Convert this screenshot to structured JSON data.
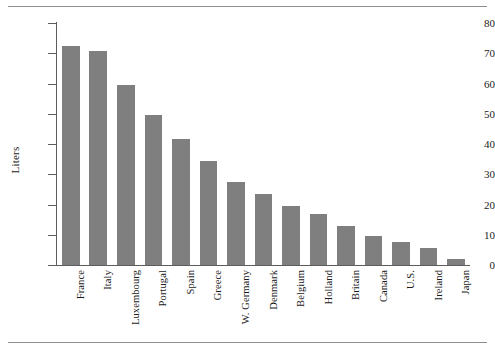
{
  "chart_data": {
    "type": "bar",
    "title": "",
    "subtitle": "",
    "xlabel": "",
    "ylabel": "Liters",
    "ylim": [
      0,
      80
    ],
    "yticks": [
      0,
      10,
      20,
      30,
      40,
      50,
      60,
      70,
      80
    ],
    "ytick_labels": [
      "0",
      "10",
      "20",
      "30",
      "40",
      "50",
      "60",
      "70",
      "80"
    ],
    "grid": false,
    "legend": false,
    "bar_color": "#807f7f",
    "axis_color": "#5d5d5d",
    "categories": [
      "France",
      "Italy",
      "Luxembourg",
      "Portugal",
      "Spain",
      "Greece",
      "W. Germany",
      "Denmark",
      "Belgium",
      "Holland",
      "Britain",
      "Canada",
      "U.S.",
      "Ireland",
      "Japan"
    ],
    "values": [
      72.5,
      70.7,
      59.5,
      49.5,
      41.5,
      34.5,
      27.5,
      23.5,
      19.5,
      17.0,
      13.0,
      9.5,
      7.5,
      5.5,
      2.0
    ]
  }
}
